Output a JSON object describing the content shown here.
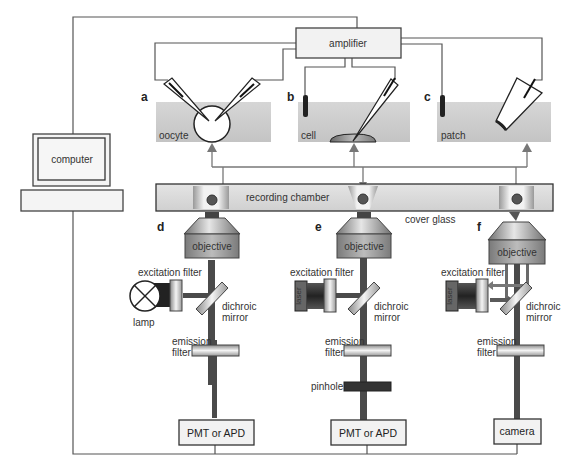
{
  "colors": {
    "wire": "#555555",
    "beam": "#4a4a4a",
    "bath": "#cfcfcf",
    "box_fill": "#f2f2f2",
    "arrow": "#777777",
    "electrode": "#222222"
  },
  "top": {
    "amplifier": "amplifier",
    "computer": "computer",
    "panels": [
      {
        "letter": "a",
        "label": "oocyte"
      },
      {
        "letter": "b",
        "label": "cell"
      },
      {
        "letter": "c",
        "label": "patch"
      }
    ]
  },
  "stage": {
    "recording_chamber": "recording chamber",
    "cover_glass": "cover glass"
  },
  "optics": [
    {
      "letter": "d",
      "objective": "objective",
      "excitation_filter": "excitation filter",
      "source": "lamp",
      "dichroic_1": "dichroic",
      "dichroic_2": "mirror",
      "emission_1": "emission",
      "emission_2": "filter",
      "detector": "PMT or APD"
    },
    {
      "letter": "e",
      "objective": "objective",
      "excitation_filter": "excitation filter",
      "source": "laser",
      "dichroic_1": "dichroic",
      "dichroic_2": "mirror",
      "emission_1": "emission",
      "emission_2": "filter",
      "pinhole": "pinhole",
      "detector": "PMT or APD"
    },
    {
      "letter": "f",
      "objective": "objective",
      "excitation_filter": "excitation filter",
      "source": "laser",
      "dichroic_1": "dichroic",
      "dichroic_2": "mirror",
      "emission_1": "emission",
      "emission_2": "filter",
      "detector": "camera"
    }
  ]
}
